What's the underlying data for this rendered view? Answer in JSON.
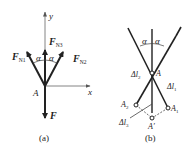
{
  "figure_a": {
    "caption": "(a)",
    "point_label": "A",
    "axis_x_label": "x",
    "axis_y_label": "y",
    "angle_left_label": "α",
    "angle_right_label": "α",
    "forces": {
      "fn1": {
        "main": "F",
        "sub": "N1"
      },
      "fn2": {
        "main": "F",
        "sub": "N2"
      },
      "fn3": {
        "main": "F",
        "sub": "N3"
      },
      "f": {
        "main": "F"
      }
    }
  },
  "figure_b": {
    "caption": "(b)",
    "point_a": "A",
    "point_a1": {
      "main": "A",
      "sub": "1"
    },
    "point_a2": {
      "main": "A",
      "sub": "2"
    },
    "point_a_prime": "A′",
    "angle_left_label": "α",
    "angle_right_label": "α",
    "dl1": {
      "main": "Δl",
      "sub": "1"
    },
    "dl2": {
      "main": "Δl",
      "sub": "2"
    },
    "dl3": {
      "main": "Δl",
      "sub": "3"
    }
  },
  "colors": {
    "ink": "#222222",
    "axis": "#666666"
  }
}
